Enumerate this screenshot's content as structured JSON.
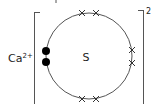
{
  "diagram": {
    "type": "dot-and-cross ionic bonding diagram",
    "cation": {
      "label": "Ca",
      "charge": "2+"
    },
    "anion": {
      "symbol": "S",
      "charge": "2-",
      "charge_visible": "2",
      "outer_shell": {
        "electrons_cross": 6,
        "electrons_dot": 2,
        "pairs": [
          {
            "position": "top",
            "kind": "cross"
          },
          {
            "position": "right",
            "kind": "cross"
          },
          {
            "position": "bottom",
            "kind": "cross"
          },
          {
            "position": "left",
            "kind": "dot"
          }
        ]
      }
    },
    "colors": {
      "line": "#555555",
      "dot": "#000000",
      "text": "#222222"
    }
  }
}
